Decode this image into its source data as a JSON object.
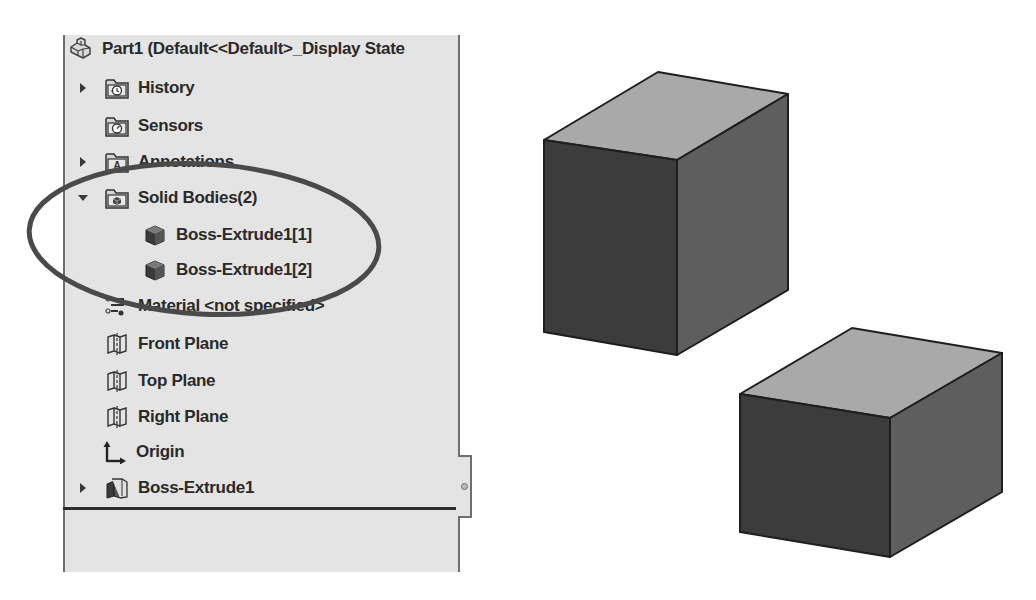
{
  "feature_tree": {
    "root": {
      "label": "Part1  (Default<<Default>_Display State",
      "icon": "part-icon"
    },
    "items": [
      {
        "label": "History",
        "icon": "history-folder-icon",
        "expander": "collapsed"
      },
      {
        "label": "Sensors",
        "icon": "sensors-folder-icon",
        "expander": "none"
      },
      {
        "label": "Annotations",
        "icon": "annotations-folder-icon",
        "expander": "collapsed"
      },
      {
        "label": "Solid Bodies(2)",
        "icon": "solid-bodies-folder-icon",
        "expander": "expanded"
      },
      {
        "label": "Boss-Extrude1[1]",
        "icon": "solid-body-icon",
        "expander": "none",
        "indent": 1
      },
      {
        "label": "Boss-Extrude1[2]",
        "icon": "solid-body-icon",
        "expander": "none",
        "indent": 1
      },
      {
        "label": "Material <not specified>",
        "icon": "material-icon",
        "expander": "none"
      },
      {
        "label": "Front Plane",
        "icon": "plane-icon",
        "expander": "none"
      },
      {
        "label": "Top Plane",
        "icon": "plane-icon",
        "expander": "none"
      },
      {
        "label": "Right Plane",
        "icon": "plane-icon",
        "expander": "none"
      },
      {
        "label": "Origin",
        "icon": "origin-icon",
        "expander": "none"
      },
      {
        "label": "Boss-Extrude1",
        "icon": "extrude-feature-icon",
        "expander": "collapsed"
      }
    ]
  },
  "highlight": {
    "shape": "ellipse",
    "color": "#4a4a4a",
    "target": "Solid Bodies(2)"
  },
  "viewport": {
    "bodies": [
      {
        "name": "Boss-Extrude1[1]",
        "top_color": "#a9a9a9",
        "left_color": "#3c3c3c",
        "right_color": "#5e5e5e"
      },
      {
        "name": "Boss-Extrude1[2]",
        "top_color": "#a9a9a9",
        "left_color": "#3c3c3c",
        "right_color": "#5e5e5e"
      }
    ]
  }
}
